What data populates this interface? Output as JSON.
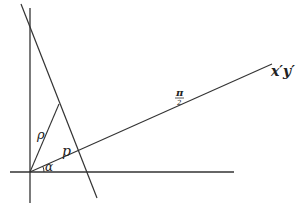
{
  "diagram": {
    "colors": {
      "background": "#ffffff",
      "ink": "#333333"
    },
    "labels": {
      "rho": "ρ",
      "p": "p",
      "alpha": "α",
      "pi": "π",
      "two": "2",
      "rotated_axis": "x′y′"
    },
    "lines": {
      "vertical_axis": {
        "x1": 30,
        "y1": 8,
        "x2": 30,
        "y2": 203
      },
      "horizontal_axis": {
        "x1": 10,
        "y1": 172,
        "x2": 234,
        "y2": 172
      },
      "oblique_line": {
        "x1": 21,
        "y1": 4,
        "x2": 97,
        "y2": 198
      },
      "rho_segment": {
        "x1": 30,
        "y1": 172,
        "x2": 59,
        "y2": 104
      },
      "rotated_axis_line": {
        "x1": 30,
        "y1": 172,
        "x2": 272,
        "y2": 64
      }
    }
  }
}
